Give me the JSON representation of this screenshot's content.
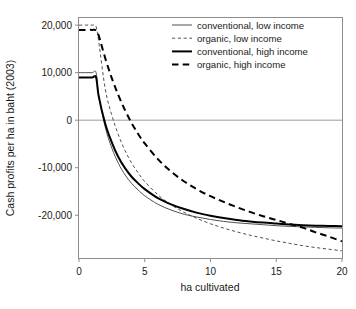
{
  "chart_data": {
    "type": "line",
    "title": "",
    "xlabel": "ha cultivated",
    "ylabel": "Cash profits per ha in baht (2003)",
    "xlim": [
      0,
      20
    ],
    "ylim": [
      -29000,
      21500
    ],
    "xticks": [
      0,
      5,
      10,
      15,
      20
    ],
    "xtick_labels": [
      "0",
      "5",
      "10",
      "15",
      "20"
    ],
    "yticks": [
      20000,
      10000,
      0,
      -10000,
      -20000
    ],
    "ytick_labels": [
      "20,000",
      "10,000",
      "0",
      "-10,000",
      "-20,000"
    ],
    "grid": false,
    "reference_lines": [
      {
        "axis": "y",
        "value": 0,
        "color": "#9a9a9a"
      }
    ],
    "legend_position": "top-right",
    "x": [
      0.0,
      0.5,
      1.0,
      1.3,
      1.5,
      2.0,
      2.5,
      3.0,
      3.5,
      4.0,
      4.5,
      5.0,
      6.0,
      7.0,
      8.0,
      9.0,
      10.0,
      11.0,
      12.0,
      13.0,
      14.0,
      15.0,
      16.0,
      17.0,
      18.0,
      19.0,
      20.0
    ],
    "series": [
      {
        "name": "conventional, low income",
        "style": "thin-solid",
        "color": "#3d3d3d",
        "values": [
          10000,
          10000,
          10000,
          10000,
          5200,
          -1500,
          -5900,
          -9100,
          -11500,
          -13300,
          -14700,
          -15900,
          -17700,
          -18900,
          -19800,
          -20400,
          -20900,
          -21300,
          -21600,
          -21800,
          -22000,
          -22200,
          -22350,
          -22450,
          -22550,
          -22650,
          -22700
        ]
      },
      {
        "name": "organic, low income",
        "style": "thin-dashed",
        "color": "#3d3d3d",
        "values": [
          20000,
          20000,
          20000,
          19700,
          16500,
          6500,
          1000,
          -3100,
          -6400,
          -9000,
          -11100,
          -12900,
          -15700,
          -17800,
          -19400,
          -20700,
          -21800,
          -22700,
          -23500,
          -24200,
          -24800,
          -25400,
          -25900,
          -26400,
          -26800,
          -27150,
          -27500
        ]
      },
      {
        "name": "conventional, high income",
        "style": "thick-solid",
        "color": "#000000",
        "values": [
          9000,
          9000,
          9000,
          9000,
          5000,
          -800,
          -4700,
          -7800,
          -10100,
          -11900,
          -13300,
          -14500,
          -16400,
          -17700,
          -18700,
          -19500,
          -20100,
          -20600,
          -21000,
          -21300,
          -21550,
          -21750,
          -21950,
          -22100,
          -22200,
          -22250,
          -22300
        ]
      },
      {
        "name": "organic, high income",
        "style": "thick-dashed",
        "color": "#000000",
        "values": [
          19000,
          19000,
          19000,
          18900,
          17800,
          13000,
          8800,
          5200,
          2100,
          -600,
          -2900,
          -4900,
          -8200,
          -10800,
          -12900,
          -14600,
          -16000,
          -17200,
          -18300,
          -19300,
          -20200,
          -21000,
          -21800,
          -22600,
          -23600,
          -24500,
          -25500
        ]
      }
    ]
  },
  "legend": {
    "entries": [
      {
        "label": "conventional, low income",
        "style": "thin-solid"
      },
      {
        "label": "organic, low income",
        "style": "thin-dashed"
      },
      {
        "label": "conventional, high income",
        "style": "thick-solid"
      },
      {
        "label": "organic, high income",
        "style": "thick-dashed"
      }
    ]
  }
}
